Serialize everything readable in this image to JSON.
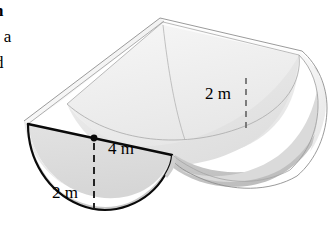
{
  "figure": {
    "name": "semicircular-trough-diagram",
    "colors": {
      "outline": "#000000",
      "thin_edge": "#9a9a9a",
      "face_light": "#f2f2f2",
      "face_mid": "#e4e4e4",
      "face_shadow": "#d2d2d2",
      "face_dark": "#c6c6c6",
      "background": "#ffffff"
    }
  },
  "caption": {
    "line_1": "h",
    "line_2": "s a",
    "line_3": "d"
  },
  "labels": {
    "diameter": "4 m",
    "radius": "2 m",
    "depth": "2 m"
  },
  "geometry": {
    "cross_section": "semicircle",
    "diameter_m": 4,
    "radius_m": 2,
    "depth_m": 2,
    "center_point": "marked-dot-on-diameter"
  }
}
